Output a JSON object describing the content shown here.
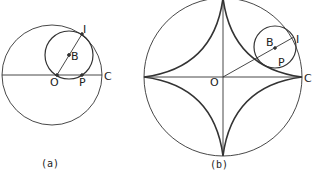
{
  "figure_a": {
    "caption": "(a)",
    "labels": {
      "I": "I",
      "B": "B",
      "O": "O",
      "P": "P",
      "C": "C"
    },
    "large_circle": {
      "cx": 52,
      "cy": 75,
      "r": 50
    },
    "rolling_circle": {
      "cx": 69,
      "cy": 55,
      "r": 24
    }
  },
  "figure_b": {
    "caption": "(b)",
    "labels": {
      "I": "I",
      "B": "B",
      "O": "O",
      "P": "P",
      "C": "C"
    },
    "large_circle": {
      "cx": 223,
      "cy": 77,
      "r": 79
    },
    "rolling_circle": {
      "cx": 275,
      "cy": 47,
      "r": 21
    },
    "curve": "astroid"
  },
  "colors": {
    "stroke": "#333333",
    "background": "#ffffff"
  }
}
